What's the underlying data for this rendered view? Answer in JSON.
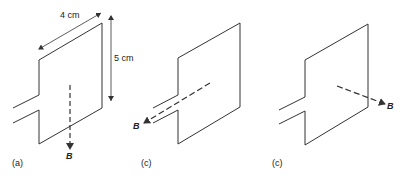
{
  "panels": [
    {
      "id": "a",
      "label": "(a)",
      "field_label": "B",
      "field_direction": "down, in plane of loop"
    },
    {
      "id": "b",
      "label": "(b)",
      "field_label": "B",
      "field_direction": "out of page toward viewer (perpendicular to loop)"
    },
    {
      "id": "c",
      "label": "(c)",
      "field_label": "B",
      "field_direction": "into page, perpendicular to loop"
    }
  ],
  "dimensions": {
    "width_label": "4 cm",
    "height_label": "5 cm"
  },
  "colors": {
    "line": "#333333",
    "background": "#ffffff"
  }
}
